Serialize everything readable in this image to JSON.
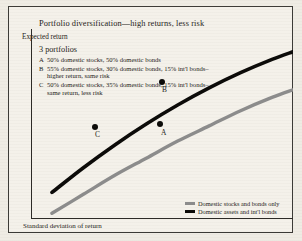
{
  "title": "Portfolio diversification—high returns, less risk",
  "axes": {
    "y_label": "Expected return",
    "x_label": "Standard deviation of return"
  },
  "portfolios": {
    "heading": "3 portfolios",
    "items": [
      {
        "key": "A",
        "text": "50% domestic stocks, 50% domestic bonds"
      },
      {
        "key": "B",
        "text": "55% domestic stocks, 30% domestic bonds, 15% int'l bonds–higher return, same risk"
      },
      {
        "key": "C",
        "text": "50% domestic stocks, 35% domestic bonds, 15% int'l bonds–same return, less risk"
      }
    ]
  },
  "legend": {
    "entries": [
      {
        "label": "Domestic stocks and bonds only",
        "color": "#8c8c8c"
      },
      {
        "label": "Domestic assets and int'l bonds",
        "color": "#0b0a08"
      }
    ]
  },
  "points": [
    {
      "label": "A",
      "series": "Domestic stocks and bonds only"
    },
    {
      "label": "B",
      "series": "Domestic assets and int'l bonds"
    },
    {
      "label": "C",
      "series": "Domestic assets and int'l bonds"
    }
  ],
  "colors": {
    "paper": "#f4f1ea",
    "ink": "#1d1b18",
    "curve_black": "#0b0a08",
    "curve_gray": "#8c8c8c"
  },
  "chart_data": {
    "type": "line",
    "title": "Portfolio diversification—high returns, less risk",
    "xlabel": "Standard deviation of return",
    "ylabel": "Expected return",
    "grid": false,
    "legend_position": "bottom-right",
    "xlim": [
      0,
      100
    ],
    "ylim": [
      0,
      100
    ],
    "axis_ticks": false,
    "series": [
      {
        "name": "Domestic stocks and bonds only",
        "color": "#8c8c8c",
        "x": [
          8,
          20,
          32,
          44,
          56,
          68,
          80,
          92,
          100
        ],
        "y": [
          3,
          13,
          23,
          32,
          41,
          49,
          57,
          64,
          68
        ]
      },
      {
        "name": "Domestic assets and int'l bonds",
        "color": "#0b0a08",
        "x": [
          8,
          20,
          32,
          44,
          56,
          68,
          80,
          92,
          100
        ],
        "y": [
          14,
          27,
          39,
          50,
          60,
          69,
          77,
          84,
          88
        ]
      }
    ],
    "annotations": [
      {
        "label": "A",
        "series": "Domestic stocks and bonds only",
        "x": 57,
        "y": 39
      },
      {
        "label": "B",
        "series": "Domestic assets and int'l bonds",
        "x": 58,
        "y": 61
      },
      {
        "label": "C",
        "series": "Domestic assets and int'l bonds",
        "x": 32,
        "y": 39
      }
    ]
  }
}
